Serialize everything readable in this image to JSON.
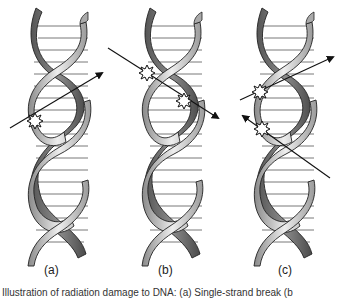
{
  "panels": [
    {
      "id": "a",
      "label": "(a)",
      "description": "single strand hit by one ionizing track"
    },
    {
      "id": "b",
      "label": "(b)",
      "description": "one track hits both strands"
    },
    {
      "id": "c",
      "label": "(c)",
      "description": "two separate tracks hit opposite strands"
    }
  ],
  "caption": "Illustration of radiation damage to DNA: (a) Single-strand break (b",
  "colors": {
    "strand_light": "#d8d8d8",
    "strand_dark": "#6a6a6a",
    "outline": "#222222",
    "rung": "#555555",
    "arrow": "#111111"
  }
}
